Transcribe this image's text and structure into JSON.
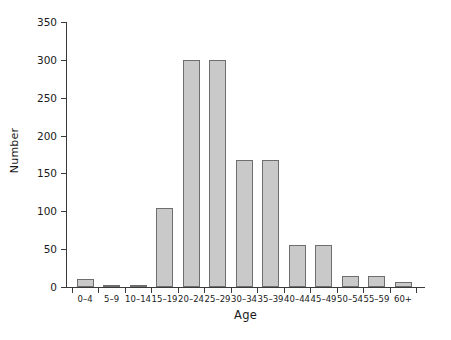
{
  "chart_data": {
    "type": "bar",
    "title": "",
    "xlabel": "Age",
    "ylabel": "Number",
    "categories": [
      "0–4",
      "5–9",
      "10–14",
      "15–19",
      "20–24",
      "25–29",
      "30–34",
      "35–39",
      "40–44",
      "45–49",
      "50–54",
      "55–59",
      "60+"
    ],
    "values": [
      11,
      2,
      2,
      104,
      300,
      300,
      168,
      168,
      55,
      55,
      15,
      15,
      7
    ],
    "ylim": [
      0,
      350
    ],
    "yticks": [
      0,
      50,
      100,
      150,
      200,
      250,
      300,
      350
    ],
    "ytick_labels": [
      "0",
      "50",
      "100",
      "150",
      "200",
      "250",
      "300",
      "350"
    ],
    "grid": false,
    "legend": null,
    "bar_fill_color": "#c9c9c9",
    "bar_border_color": "#6e6e6e",
    "axis_color": "#3a3a3a",
    "background_color": "#ffffff"
  }
}
